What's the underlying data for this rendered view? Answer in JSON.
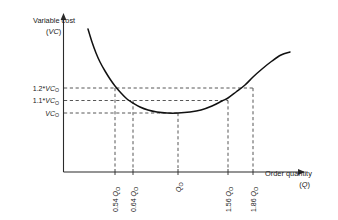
{
  "chart_data": {
    "type": "line",
    "title": "",
    "ylabel_line1": "Variable cost",
    "ylabel_line2_open": "(",
    "ylabel_line2_sym": "VC",
    "ylabel_line2_close": ")",
    "xlabel_line1": "Order quantity",
    "xlabel_line2_open": "(",
    "xlabel_line2_sym": "Q",
    "xlabel_line2_close": ")",
    "grid": false,
    "legend": "none",
    "y_ticks": [
      {
        "id": "y-1-2",
        "coef": "1.2*",
        "sym": "VC",
        "sub": "O",
        "label": "1.2*VCO",
        "value": 1.2
      },
      {
        "id": "y-1-1",
        "coef": "1.1*",
        "sym": "VC",
        "sub": "O",
        "label": "1.1*VCO",
        "value": 1.1
      },
      {
        "id": "y-1-0",
        "coef": "",
        "sym": "VC",
        "sub": "O",
        "label": "VCO",
        "value": 1.0
      }
    ],
    "x_ticks": [
      {
        "id": "x-054",
        "coef": "0.54",
        "sym": "Q",
        "sub": "O",
        "label": "0.54 QO",
        "value": 0.54
      },
      {
        "id": "x-064",
        "coef": "0.64",
        "sym": "Q",
        "sub": "O",
        "label": "0.64 QO",
        "value": 0.64
      },
      {
        "id": "x-100",
        "coef": "",
        "sym": "Q",
        "sub": "O",
        "label": "QO",
        "value": 1.0
      },
      {
        "id": "x-156",
        "coef": "1.56",
        "sym": "Q",
        "sub": "O",
        "label": "1.56 QO",
        "value": 1.56
      },
      {
        "id": "x-186",
        "coef": "1.86",
        "sym": "Q",
        "sub": "O",
        "label": "1.86 QO",
        "value": 1.86
      }
    ],
    "curve_points_px": [
      [
        88,
        29
      ],
      [
        92,
        42
      ],
      [
        96,
        53
      ],
      [
        100,
        62
      ],
      [
        105,
        71
      ],
      [
        110,
        79
      ],
      [
        115,
        86
      ],
      [
        121,
        93
      ],
      [
        127,
        99
      ],
      [
        133,
        103
      ],
      [
        140,
        107
      ],
      [
        148,
        110
      ],
      [
        157,
        112
      ],
      [
        167,
        113
      ],
      [
        178,
        113
      ],
      [
        190,
        112
      ],
      [
        201,
        110
      ],
      [
        212,
        106
      ],
      [
        222,
        101
      ],
      [
        228,
        98
      ],
      [
        236,
        92
      ],
      [
        245,
        85
      ],
      [
        253,
        77
      ],
      [
        262,
        69
      ],
      [
        272,
        61
      ],
      [
        281,
        55
      ],
      [
        290,
        52
      ]
    ],
    "intersections": [
      {
        "x_value": 0.54,
        "y_value": 1.2
      },
      {
        "x_value": 0.64,
        "y_value": 1.1
      },
      {
        "x_value": 1.0,
        "y_value": 1.0
      },
      {
        "x_value": 1.56,
        "y_value": 1.1
      },
      {
        "x_value": 1.86,
        "y_value": 1.2
      }
    ],
    "colors": {
      "curve": "#111111",
      "axis": "#2b2b2b",
      "dash": "#444444",
      "background": "#ffffff"
    }
  }
}
